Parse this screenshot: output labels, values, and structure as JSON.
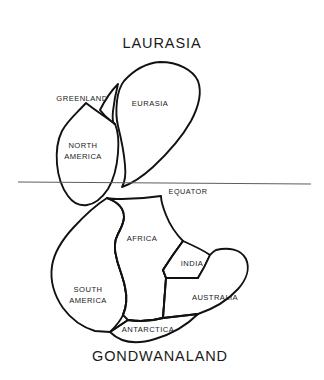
{
  "figure": {
    "name": "pangaea-continental-drift-diagram",
    "titles": {
      "northern": "LAURASIA",
      "southern": "GONDWANALAND"
    },
    "reference_line": {
      "label": "EQUATOR",
      "color": "#5e5e5e"
    },
    "style": {
      "outline_color": "#111111",
      "fill_color": "#ffffff",
      "background": "#ffffff"
    },
    "regions": [
      {
        "id": "greenland",
        "label": "GREENLAND",
        "group": "LAURASIA",
        "label_x": 82,
        "label_y": 99,
        "lines": [
          "GREENLAND"
        ]
      },
      {
        "id": "eurasia",
        "label": "EURASIA",
        "group": "LAURASIA",
        "label_x": 150,
        "label_y": 104,
        "lines": [
          "EURASIA"
        ]
      },
      {
        "id": "north-america",
        "label": "NORTH AMERICA",
        "group": "LAURASIA",
        "label_x": 83,
        "label_y": 146,
        "lines": [
          "NORTH",
          "AMERICA"
        ]
      },
      {
        "id": "africa",
        "label": "AFRICA",
        "group": "GONDWANALAND",
        "label_x": 142,
        "label_y": 239,
        "lines": [
          "AFRICA"
        ]
      },
      {
        "id": "india",
        "label": "INDIA",
        "group": "GONDWANALAND",
        "label_x": 192,
        "label_y": 264,
        "lines": [
          "INDIA"
        ]
      },
      {
        "id": "south-america",
        "label": "SOUTH AMERICA",
        "group": "GONDWANALAND",
        "label_x": 88,
        "label_y": 290,
        "lines": [
          "SOUTH",
          "AMERICA"
        ]
      },
      {
        "id": "australia",
        "label": "AUSTRALIA",
        "group": "GONDWANALAND",
        "label_x": 215,
        "label_y": 298,
        "lines": [
          "AUSTRALIA"
        ]
      },
      {
        "id": "antarctica",
        "label": "ANTARCTICA",
        "group": "GONDWANALAND",
        "label_x": 148,
        "label_y": 330,
        "lines": [
          "ANTARCTICA"
        ]
      }
    ]
  }
}
